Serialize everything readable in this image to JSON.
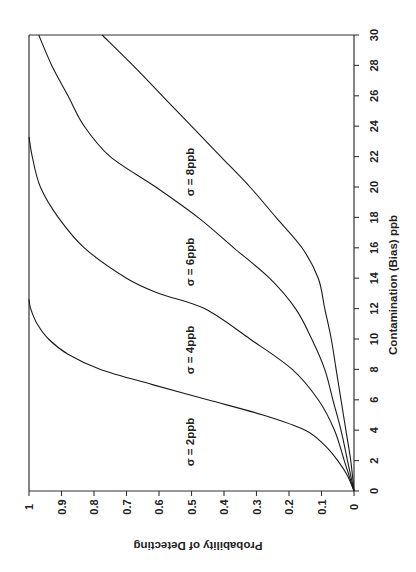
{
  "chart_data": {
    "type": "line",
    "title": "",
    "orientation_note": "figure rotated 90 degrees: contamination axis vertical on right, probability axis horizontal at bottom",
    "xlabel": "Contamination (Bias) ppb",
    "ylabel": "Probability of Detecting",
    "xlim": [
      0,
      30
    ],
    "ylim": [
      0,
      1
    ],
    "x_ticks": [
      0,
      2,
      4,
      6,
      8,
      10,
      12,
      14,
      16,
      18,
      20,
      22,
      24,
      26,
      28,
      30
    ],
    "y_ticks": [
      "1",
      "0.9",
      "0.8",
      "0.7",
      "0.6",
      "0.5",
      "0.4",
      "0.3",
      "0.2",
      "0.1",
      "0"
    ],
    "grid": false,
    "legend": "inline labels",
    "series": [
      {
        "name": "σ = 2ppb",
        "x": [
          0,
          1,
          2,
          3,
          4,
          5,
          6,
          7,
          8,
          9,
          10,
          11,
          12,
          12.6
        ],
        "y": [
          0,
          0.02,
          0.05,
          0.09,
          0.15,
          0.28,
          0.45,
          0.62,
          0.78,
          0.88,
          0.94,
          0.975,
          0.995,
          1.0
        ]
      },
      {
        "name": "σ = 4ppb",
        "x": [
          0,
          2,
          4,
          6,
          8,
          10,
          12,
          13,
          14,
          16,
          18,
          20,
          22,
          23.3
        ],
        "y": [
          0,
          0.03,
          0.06,
          0.11,
          0.19,
          0.32,
          0.46,
          0.6,
          0.7,
          0.83,
          0.91,
          0.965,
          0.99,
          1.0
        ]
      },
      {
        "name": "σ = 6ppb",
        "x": [
          0,
          2,
          4,
          6,
          8,
          10,
          12,
          14,
          16,
          18,
          20,
          22,
          24,
          26,
          28,
          30
        ],
        "y": [
          0,
          0.02,
          0.04,
          0.065,
          0.09,
          0.13,
          0.18,
          0.26,
          0.37,
          0.48,
          0.61,
          0.75,
          0.83,
          0.88,
          0.93,
          0.97
        ]
      },
      {
        "name": "σ = 8ppb",
        "x": [
          0,
          2,
          4,
          6,
          8,
          10,
          12,
          14,
          16,
          18,
          20,
          22,
          24,
          26,
          28,
          30
        ],
        "y": [
          0,
          0.01,
          0.025,
          0.04,
          0.055,
          0.07,
          0.09,
          0.11,
          0.16,
          0.24,
          0.32,
          0.41,
          0.5,
          0.59,
          0.68,
          0.775
        ]
      }
    ],
    "annotations": [
      "σ = 2ppb",
      "σ = 4ppb",
      "σ = 6ppb",
      "σ = 8ppb"
    ]
  },
  "labels": {
    "xlabel": "Contamination (Bias) ppb",
    "ylabel": "Probability of Detecting",
    "s2": "σ = 2ppb",
    "s4": "σ = 4ppb",
    "s6": "σ = 6ppb",
    "s8": "σ = 8ppb"
  },
  "ticks": {
    "c": [
      "0",
      "2",
      "4",
      "6",
      "8",
      "10",
      "12",
      "14",
      "16",
      "18",
      "20",
      "22",
      "24",
      "26",
      "28",
      "30"
    ],
    "p": [
      "1",
      "0.9",
      "0.8",
      "0.7",
      "0.6",
      "0.5",
      "0.4",
      "0.3",
      "0.2",
      "0.1",
      "0"
    ]
  }
}
